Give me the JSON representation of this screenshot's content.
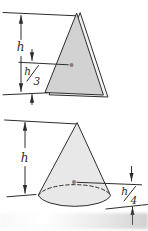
{
  "figure": {
    "background": "#ffffff",
    "line_color": "#2d2d2d",
    "top_figure": {
      "height_label": "h",
      "offset_numerator": "h",
      "offset_denominator": "3",
      "face_fill": "#d2d2d2",
      "edge_fill": "#f3f3f3",
      "centroid_color": "#8b7d74"
    },
    "bottom_figure": {
      "height_label": "h",
      "offset_numerator": "h",
      "offset_denominator": "4",
      "body_fill": "#e8e8e8",
      "centroid_color": "#8b7d74"
    }
  }
}
